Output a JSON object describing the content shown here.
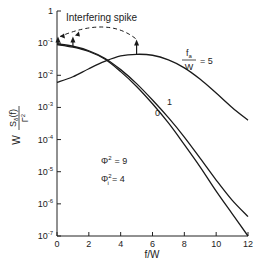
{
  "chart_data": {
    "type": "line",
    "title": "",
    "xlabel": "f/W",
    "ylabel": "W S_δ(f) / Γ²",
    "ylabel_parts": {
      "prefix": "W",
      "num": "S",
      "num_sub": "δ",
      "num_arg": "(f)",
      "den": "Γ",
      "den_sup": "2"
    },
    "xscale": "linear",
    "yscale": "log",
    "xlim": [
      0,
      12
    ],
    "ylim": [
      1e-07,
      1
    ],
    "x_ticks": [
      0,
      2,
      4,
      6,
      8,
      10,
      12
    ],
    "x_tick_labels": [
      "0",
      "2",
      "4",
      "6",
      "8",
      "10",
      "12"
    ],
    "y_ticks": [
      1,
      0.1,
      0.01,
      0.001,
      0.0001,
      1e-05,
      1e-06,
      1e-07
    ],
    "y_tick_labels": [
      {
        "base": "1",
        "exp": ""
      },
      {
        "base": "10",
        "exp": "-1"
      },
      {
        "base": "10",
        "exp": "-2"
      },
      {
        "base": "10",
        "exp": "-3"
      },
      {
        "base": "10",
        "exp": "-4"
      },
      {
        "base": "10",
        "exp": "-5"
      },
      {
        "base": "10",
        "exp": "-6"
      },
      {
        "base": "10",
        "exp": "-7"
      }
    ],
    "grid": false,
    "series": [
      {
        "name": "f_a/W = 0",
        "label": "0",
        "x": [
          0,
          1,
          2,
          3,
          4,
          5,
          6,
          7,
          8,
          9,
          10,
          11,
          12
        ],
        "y": [
          0.09,
          0.075,
          0.055,
          0.032,
          0.013,
          0.0045,
          0.0013,
          0.00033,
          7e-05,
          1.4e-05,
          2.5e-06,
          5e-07,
          1e-07
        ]
      },
      {
        "name": "f_a/W = 1",
        "label": "1",
        "x": [
          0,
          1,
          2,
          3,
          4,
          5,
          6,
          7,
          8,
          9,
          10,
          11,
          12
        ],
        "y": [
          0.095,
          0.08,
          0.058,
          0.034,
          0.015,
          0.0055,
          0.0017,
          0.00048,
          0.00012,
          2.6e-05,
          5.5e-06,
          1.3e-06,
          4e-07
        ]
      },
      {
        "name": "f_a/W = 5",
        "label_num": "f",
        "label_num_sub": "a",
        "label_den": "W",
        "label_value": "= 5",
        "x": [
          0,
          1,
          2,
          3,
          4,
          5,
          6,
          7,
          8,
          9,
          10,
          11,
          12
        ],
        "y": [
          0.006,
          0.009,
          0.016,
          0.027,
          0.04,
          0.045,
          0.042,
          0.03,
          0.017,
          0.0075,
          0.0028,
          0.001,
          0.0004
        ]
      }
    ],
    "annotations": {
      "spike_label": "Interfering spike",
      "spike_positions_x": [
        0,
        1,
        5
      ],
      "spike_tops_y": [
        0.15,
        0.15,
        0.12
      ],
      "spike_bases_y": [
        0.09,
        0.08,
        0.045
      ],
      "params": [
        {
          "symbol": "Φ",
          "sub": "",
          "sup": "2",
          "value": "= 9"
        },
        {
          "symbol": "Φ",
          "sub": "i",
          "sup": "2",
          "value": "= 4"
        }
      ]
    }
  }
}
